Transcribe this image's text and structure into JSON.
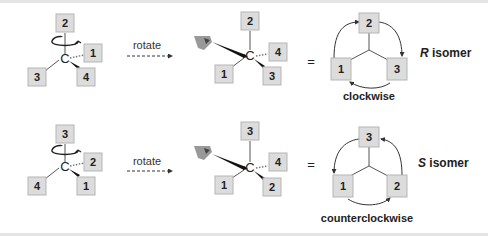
{
  "rows": [
    {
      "start": {
        "top": "2",
        "right": "1",
        "left": "3",
        "wedge": "4"
      },
      "rotate_label": "rotate",
      "rotated": {
        "top": "2",
        "right": "4",
        "left": "1",
        "wedge": "3"
      },
      "equals": "=",
      "cycle": {
        "top": "2",
        "left": "1",
        "right": "3"
      },
      "direction": "clockwise",
      "isomer_letter": "R",
      "isomer_word": " isomer"
    },
    {
      "start": {
        "top": "3",
        "right": "2",
        "left": "4",
        "wedge": "1"
      },
      "rotate_label": "rotate",
      "rotated": {
        "top": "3",
        "right": "4",
        "left": "1",
        "wedge": "2"
      },
      "equals": "=",
      "cycle": {
        "top": "3",
        "left": "1",
        "right": "2"
      },
      "direction": "counterclockwise",
      "isomer_letter": "S",
      "isomer_word": " isomer"
    }
  ],
  "carbon": "C"
}
